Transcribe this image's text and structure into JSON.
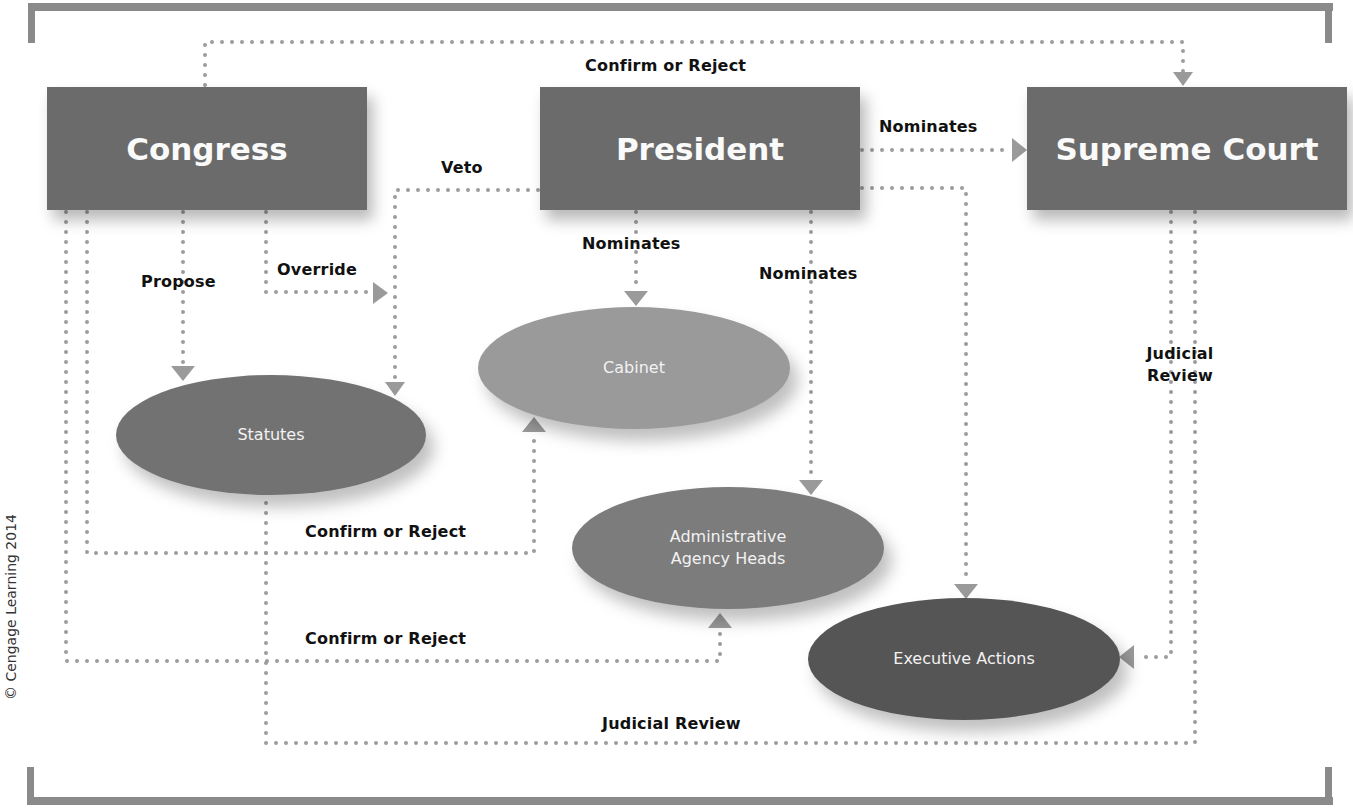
{
  "diagram": {
    "title": "",
    "nodes": {
      "congress": {
        "label": "Congress",
        "shape": "rectangle"
      },
      "president": {
        "label": "President",
        "shape": "rectangle"
      },
      "supreme_court": {
        "label": "Supreme Court",
        "shape": "rectangle"
      },
      "statutes": {
        "label": "Statutes",
        "shape": "ellipse"
      },
      "cabinet": {
        "label": "Cabinet",
        "shape": "ellipse"
      },
      "agency_heads": {
        "label": "Administrative Agency Heads",
        "line1": "Administrative",
        "line2": "Agency Heads",
        "shape": "ellipse"
      },
      "executive_actions": {
        "label": "Executive Actions",
        "shape": "ellipse"
      }
    },
    "edges": [
      {
        "from": "Congress",
        "to": "Supreme Court",
        "label": "Confirm or Reject"
      },
      {
        "from": "President",
        "to": "Supreme Court",
        "label": "Nominates"
      },
      {
        "from": "President",
        "to": "Statutes",
        "label": "Veto"
      },
      {
        "from": "Congress",
        "to": "Statutes",
        "label": "Propose"
      },
      {
        "from": "Congress",
        "to": "Statutes",
        "label": "Override"
      },
      {
        "from": "President",
        "to": "Cabinet",
        "label": "Nominates"
      },
      {
        "from": "President",
        "to": "Administrative Agency Heads",
        "label": "Nominates"
      },
      {
        "from": "President",
        "to": "Executive Actions",
        "label": ""
      },
      {
        "from": "Congress",
        "to": "Cabinet",
        "label": "Confirm or Reject"
      },
      {
        "from": "Congress",
        "to": "Administrative Agency Heads",
        "label": "Confirm or Reject"
      },
      {
        "from": "Supreme Court",
        "to": "Executive Actions",
        "label": "Judicial Review"
      },
      {
        "from": "Supreme Court",
        "to": "Statutes",
        "label": "Judicial Review"
      }
    ],
    "labels": {
      "confirm_reject_top": "Confirm or Reject",
      "nominates_court": "Nominates",
      "veto": "Veto",
      "propose": "Propose",
      "override": "Override",
      "nominates_cabinet": "Nominates",
      "nominates_agency": "Nominates",
      "judicial_review_right_1": "Judicial",
      "judicial_review_right_2": "Review",
      "confirm_reject_cabinet": "Confirm or Reject",
      "confirm_reject_agency": "Confirm or Reject",
      "judicial_review_bottom": "Judicial Review"
    },
    "copyright": "© Cengage Learning 2014",
    "colors": {
      "box": "#6b6b6b",
      "statutes": "#727272",
      "cabinet": "#9a9a9a",
      "agency_heads": "#7c7c7c",
      "executive_actions": "#555555",
      "connector": "#9c9c9c",
      "frame": "#8a8a8a"
    }
  }
}
